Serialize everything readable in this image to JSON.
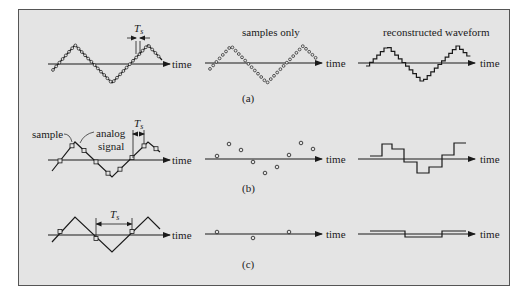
{
  "figure": {
    "background": "#e4e4e4",
    "border": "#555555",
    "ink": "#1a1a1a",
    "axis_label": "time",
    "rows": [
      {
        "caption": "(a)",
        "period_label": "T",
        "period_subscript": "s",
        "panels": [
          {
            "title": "",
            "kind": "analog-dense-samples"
          },
          {
            "title": "samples only",
            "kind": "samples-dense"
          },
          {
            "title": "reconstructed waveform",
            "kind": "staircase-dense"
          }
        ]
      },
      {
        "caption": "(b)",
        "period_label": "T",
        "period_subscript": "s",
        "annotations": {
          "sample": "sample",
          "analog_1": "analog",
          "analog_2": "signal"
        },
        "panels": [
          {
            "title": "",
            "kind": "analog-medium-samples"
          },
          {
            "title": "",
            "kind": "samples-medium"
          },
          {
            "title": "",
            "kind": "staircase-medium"
          }
        ]
      },
      {
        "caption": "(c)",
        "period_label": "T",
        "period_subscript": "s",
        "panels": [
          {
            "title": "",
            "kind": "analog-sparse-samples"
          },
          {
            "title": "",
            "kind": "samples-sparse"
          },
          {
            "title": "",
            "kind": "staircase-sparse"
          }
        ]
      }
    ]
  }
}
